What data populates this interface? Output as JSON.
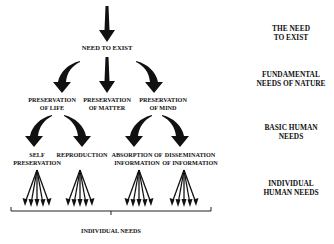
{
  "diagram": {
    "root": {
      "label": "NEED TO EXIST"
    },
    "fundamental": [
      {
        "line1": "PRESERVATION",
        "line2": "OF LIFE"
      },
      {
        "line1": "PRESERVATION",
        "line2": "OF MATTER"
      },
      {
        "line1": "PRESERVATION",
        "line2": "OF MIND"
      }
    ],
    "basic": [
      {
        "line1": "SELF",
        "line2": "PRESERVATION"
      },
      {
        "line1": "REPRODUCTION",
        "line2": ""
      },
      {
        "line1": "ABSORPTION OF",
        "line2": "INFORMATION"
      },
      {
        "line1": "DISSEMINATION",
        "line2": "OF INFORMATION"
      }
    ],
    "bracket_label": "INDIVIDUAL NEEDS"
  },
  "levels": [
    {
      "line1": "THE NEED",
      "line2": "TO EXIST"
    },
    {
      "line1": "FUNDAMENTAL",
      "line2": "NEEDS OF NATURE"
    },
    {
      "line1": "BASIC HUMAN",
      "line2": "NEEDS"
    },
    {
      "line1": "INDIVIDUAL",
      "line2": "HUMAN NEEDS"
    }
  ],
  "colors": {
    "ink": "#111111",
    "background": "#ffffff"
  }
}
